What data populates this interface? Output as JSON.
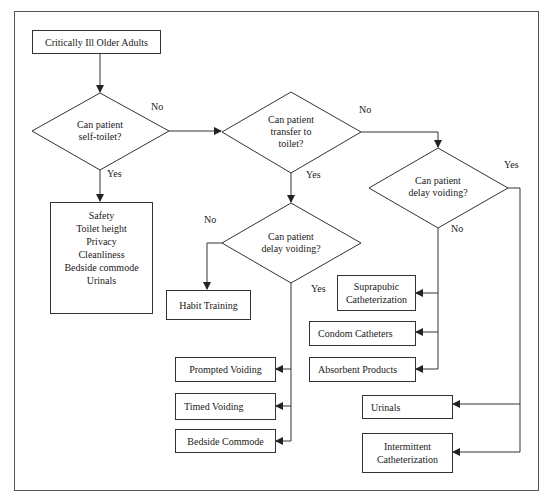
{
  "diagram": {
    "type": "flowchart",
    "start": {
      "label": "Critically Ill Older Adults"
    },
    "decisions": [
      {
        "id": "d1",
        "lines": [
          "Can patient",
          "self-toilet?"
        ]
      },
      {
        "id": "d2",
        "lines": [
          "Can patient",
          "transfer to",
          "toilet?"
        ]
      },
      {
        "id": "d3",
        "lines": [
          "Can patient",
          "delay voiding?"
        ]
      },
      {
        "id": "d4",
        "lines": [
          "Can patient",
          "delay voiding?"
        ]
      }
    ],
    "edge_labels": {
      "d1_no": "No",
      "d1_yes": "Yes",
      "d2_no": "No",
      "d2_yes": "Yes",
      "d3_yes": "Yes",
      "d3_no": "No",
      "d4_no": "No",
      "d4_yes": "Yes"
    },
    "outcomes": {
      "self_toilet": [
        "Safety",
        "Toilet height",
        "Privacy",
        "Cleanliness",
        "Bedside commode",
        "Urinals"
      ],
      "habit_training": "Habit Training",
      "prompted_voiding": "Prompted Voiding",
      "timed_voiding": "Timed Voiding",
      "bedside_commode": "Bedside Commode",
      "suprapubic": [
        "Suprapubic",
        "Catheterization"
      ],
      "condom_catheters": "Condom Catheters",
      "absorbent_products": "Absorbent Products",
      "urinals": "Urinals",
      "intermittent": [
        "Intermittent",
        "Catheterization"
      ]
    },
    "colors": {
      "stroke": "#333333",
      "background": "#ffffff",
      "text": "#1a1a1a"
    }
  }
}
